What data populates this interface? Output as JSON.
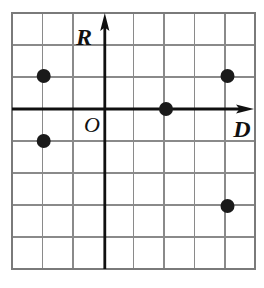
{
  "figure": {
    "background_color": "#ffffff",
    "grid": {
      "color": "#888888",
      "border_color": "#777777",
      "columns": 8,
      "rows": 8,
      "cell_width_px": 30.4,
      "cell_height_px": 32.0,
      "left_px": 12,
      "top_px": 13,
      "right_px": 255,
      "bottom_px": 269
    },
    "axes": {
      "color": "#101010",
      "origin_px": {
        "x": 104.8,
        "y": 109.0
      },
      "vertical": {
        "name": "R",
        "label": "R",
        "label_position": "above-left-of-arrow",
        "arrow": "up"
      },
      "horizontal": {
        "name": "D",
        "label": "D",
        "label_position": "below-left-of-arrow",
        "arrow": "right"
      },
      "origin": {
        "label": "O",
        "label_position": "below-left-of-origin"
      }
    }
  },
  "chart_data": {
    "type": "scatter",
    "title": "",
    "xlabel": "D",
    "ylabel": "R",
    "xlim": [
      -3,
      5
    ],
    "ylim": [
      -5,
      3
    ],
    "grid": true,
    "legend": false,
    "point_color": "#1a1a1a",
    "point_radius_px": 7,
    "points": [
      {
        "x": -2,
        "y": 1,
        "px": 43.7,
        "py": 76.0
      },
      {
        "x": -2,
        "y": -1,
        "px": 43.7,
        "py": 141.0
      },
      {
        "x": 2,
        "y": 0,
        "px": 166.0,
        "py": 109.0
      },
      {
        "x": 4,
        "y": 1,
        "px": 227.5,
        "py": 76.0
      },
      {
        "x": 4,
        "y": -3,
        "px": 227.5,
        "py": 206.0
      }
    ]
  }
}
